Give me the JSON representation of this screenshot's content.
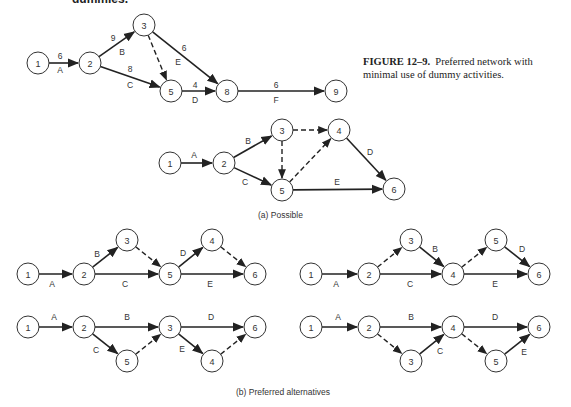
{
  "heading_fragment": "dummies.",
  "caption": {
    "figure_number": "FIGURE 12–9.",
    "text": "Preferred network with minimal use of dummy activities."
  },
  "subcaptions": {
    "a": "(a)  Possible",
    "b": "(b)  Preferred alternatives"
  },
  "diagrams": [
    {
      "id": "top-network",
      "nodes": [
        {
          "id": "1",
          "x": 38,
          "y": 63
        },
        {
          "id": "2",
          "x": 90,
          "y": 63
        },
        {
          "id": "3",
          "x": 144,
          "y": 25
        },
        {
          "id": "5",
          "x": 171,
          "y": 91
        },
        {
          "id": "8",
          "x": 227,
          "y": 91
        },
        {
          "id": "9",
          "x": 336,
          "y": 91
        }
      ],
      "edges": [
        {
          "from": "1",
          "to": "2",
          "type": "solid",
          "label": "A",
          "duration": "6",
          "lx": 60,
          "ly": 70,
          "dx": 60,
          "dy": 56
        },
        {
          "from": "2",
          "to": "3",
          "type": "solid",
          "label": "B",
          "duration": "9",
          "lx": 122,
          "ly": 52,
          "dx": 113,
          "dy": 38
        },
        {
          "from": "2",
          "to": "5",
          "type": "solid",
          "label": "C",
          "duration": "8",
          "lx": 130,
          "ly": 85,
          "dx": 130,
          "dy": 69
        },
        {
          "from": "3",
          "to": "5",
          "type": "dashed"
        },
        {
          "from": "3",
          "to": "8",
          "type": "solid",
          "label": "E",
          "duration": "6",
          "lx": 178,
          "ly": 62,
          "dx": 184,
          "dy": 48
        },
        {
          "from": "5",
          "to": "8",
          "type": "solid",
          "label": "D",
          "duration": "4",
          "lx": 195,
          "ly": 100,
          "dx": 195,
          "dy": 85
        },
        {
          "from": "8",
          "to": "9",
          "type": "solid",
          "label": "F",
          "duration": "6",
          "lx": 276,
          "ly": 100,
          "dx": 276,
          "dy": 85
        }
      ]
    },
    {
      "id": "possible-network",
      "nodes": [
        {
          "id": "1",
          "x": 170,
          "y": 163
        },
        {
          "id": "2",
          "x": 224,
          "y": 163
        },
        {
          "id": "3",
          "x": 282,
          "y": 130
        },
        {
          "id": "4",
          "x": 339,
          "y": 130
        },
        {
          "id": "5",
          "x": 282,
          "y": 190
        },
        {
          "id": "6",
          "x": 394,
          "y": 189
        }
      ],
      "edges": [
        {
          "from": "1",
          "to": "2",
          "type": "solid",
          "label": "A",
          "lx": 194,
          "ly": 155
        },
        {
          "from": "2",
          "to": "3",
          "type": "solid",
          "label": "B",
          "lx": 248,
          "ly": 141
        },
        {
          "from": "2",
          "to": "5",
          "type": "solid",
          "label": "C",
          "lx": 245,
          "ly": 182
        },
        {
          "from": "3",
          "to": "4",
          "type": "dashed"
        },
        {
          "from": "3",
          "to": "5",
          "type": "dashed"
        },
        {
          "from": "5",
          "to": "4",
          "type": "dashed"
        },
        {
          "from": "4",
          "to": "6",
          "type": "solid",
          "label": "D",
          "lx": 370,
          "ly": 152
        },
        {
          "from": "5",
          "to": "6",
          "type": "solid",
          "label": "E",
          "lx": 337,
          "ly": 182
        }
      ]
    },
    {
      "id": "preferred-alt-1",
      "nodes": [
        {
          "id": "1",
          "x": 28,
          "y": 274
        },
        {
          "id": "2",
          "x": 84,
          "y": 274
        },
        {
          "id": "3",
          "x": 127,
          "y": 240
        },
        {
          "id": "5",
          "x": 170,
          "y": 274
        },
        {
          "id": "4",
          "x": 212,
          "y": 240
        },
        {
          "id": "6",
          "x": 255,
          "y": 274
        }
      ],
      "edges": [
        {
          "from": "1",
          "to": "2",
          "type": "solid",
          "label": "A",
          "lx": 52,
          "ly": 284
        },
        {
          "from": "2",
          "to": "3",
          "type": "solid",
          "label": "B",
          "lx": 97,
          "ly": 254
        },
        {
          "from": "2",
          "to": "5",
          "type": "solid",
          "label": "C",
          "lx": 125,
          "ly": 284
        },
        {
          "from": "3",
          "to": "5",
          "type": "dashed"
        },
        {
          "from": "5",
          "to": "4",
          "type": "solid",
          "label": "D",
          "lx": 183,
          "ly": 253
        },
        {
          "from": "4",
          "to": "6",
          "type": "dashed"
        },
        {
          "from": "5",
          "to": "6",
          "type": "solid",
          "label": "E",
          "lx": 210,
          "ly": 284
        }
      ]
    },
    {
      "id": "preferred-alt-2",
      "nodes": [
        {
          "id": "1",
          "x": 311,
          "y": 274
        },
        {
          "id": "2",
          "x": 369,
          "y": 274
        },
        {
          "id": "3",
          "x": 411,
          "y": 240
        },
        {
          "id": "4",
          "x": 453,
          "y": 274
        },
        {
          "id": "5",
          "x": 496,
          "y": 240
        },
        {
          "id": "6",
          "x": 539,
          "y": 274
        }
      ],
      "edges": [
        {
          "from": "1",
          "to": "2",
          "type": "solid",
          "label": "A",
          "lx": 336,
          "ly": 284
        },
        {
          "from": "2",
          "to": "3",
          "type": "dashed"
        },
        {
          "from": "3",
          "to": "4",
          "type": "solid",
          "label": "B",
          "lx": 435,
          "ly": 249
        },
        {
          "from": "2",
          "to": "4",
          "type": "solid",
          "label": "C",
          "lx": 410,
          "ly": 284
        },
        {
          "from": "4",
          "to": "5",
          "type": "dashed"
        },
        {
          "from": "5",
          "to": "6",
          "type": "solid",
          "label": "D",
          "lx": 522,
          "ly": 249
        },
        {
          "from": "4",
          "to": "6",
          "type": "solid",
          "label": "E",
          "lx": 495,
          "ly": 284
        }
      ]
    },
    {
      "id": "preferred-alt-3",
      "nodes": [
        {
          "id": "1",
          "x": 28,
          "y": 327
        },
        {
          "id": "2",
          "x": 84,
          "y": 327
        },
        {
          "id": "3",
          "x": 170,
          "y": 327
        },
        {
          "id": "5",
          "x": 127,
          "y": 361
        },
        {
          "id": "4",
          "x": 212,
          "y": 361
        },
        {
          "id": "6",
          "x": 255,
          "y": 327
        }
      ],
      "edges": [
        {
          "from": "1",
          "to": "2",
          "type": "solid",
          "label": "A",
          "lx": 54,
          "ly": 317
        },
        {
          "from": "2",
          "to": "3",
          "type": "solid",
          "label": "B",
          "lx": 127,
          "ly": 317
        },
        {
          "from": "2",
          "to": "5",
          "type": "solid",
          "label": "C",
          "lx": 96,
          "ly": 350
        },
        {
          "from": "5",
          "to": "3",
          "type": "dashed"
        },
        {
          "from": "3",
          "to": "6",
          "type": "solid",
          "label": "D",
          "lx": 211,
          "ly": 317
        },
        {
          "from": "3",
          "to": "4",
          "type": "solid",
          "label": "E",
          "lx": 182,
          "ly": 349
        },
        {
          "from": "4",
          "to": "6",
          "type": "dashed"
        }
      ]
    },
    {
      "id": "preferred-alt-4",
      "nodes": [
        {
          "id": "1",
          "x": 311,
          "y": 327
        },
        {
          "id": "2",
          "x": 369,
          "y": 327
        },
        {
          "id": "4",
          "x": 453,
          "y": 327
        },
        {
          "id": "3",
          "x": 411,
          "y": 361
        },
        {
          "id": "5",
          "x": 496,
          "y": 361
        },
        {
          "id": "6",
          "x": 539,
          "y": 327
        }
      ],
      "edges": [
        {
          "from": "1",
          "to": "2",
          "type": "solid",
          "label": "A",
          "lx": 338,
          "ly": 317
        },
        {
          "from": "2",
          "to": "4",
          "type": "solid",
          "label": "B",
          "lx": 411,
          "ly": 317
        },
        {
          "from": "2",
          "to": "3",
          "type": "dashed"
        },
        {
          "from": "3",
          "to": "4",
          "type": "solid",
          "label": "C",
          "lx": 440,
          "ly": 351
        },
        {
          "from": "4",
          "to": "6",
          "type": "solid",
          "label": "D",
          "lx": 495,
          "ly": 317
        },
        {
          "from": "4",
          "to": "5",
          "type": "dashed"
        },
        {
          "from": "5",
          "to": "6",
          "type": "solid",
          "label": "E",
          "lx": 524,
          "ly": 352
        }
      ]
    }
  ],
  "colors": {
    "line": "#222222",
    "text": "#333333",
    "background": "#ffffff"
  }
}
